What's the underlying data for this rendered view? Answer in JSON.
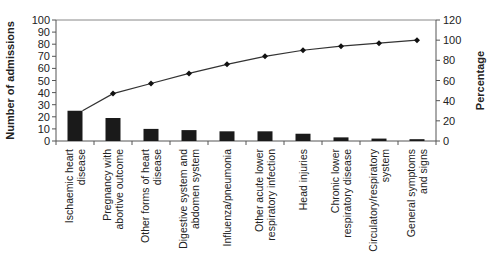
{
  "chart_data": {
    "type": "bar",
    "subtype": "pareto (bar + cumulative line)",
    "title": "",
    "xlabel": "",
    "ylabel": "Number of admissions",
    "y2label": "Percentage",
    "ylim": [
      0,
      100
    ],
    "y2lim": [
      0,
      120
    ],
    "yticks": [
      0,
      10,
      20,
      30,
      40,
      50,
      60,
      70,
      80,
      90,
      100
    ],
    "y2ticks": [
      0,
      20,
      40,
      60,
      80,
      100,
      120
    ],
    "grid": false,
    "legend": "none",
    "categories": [
      [
        "Ischaemic heart",
        "disease"
      ],
      [
        "Pregnancy with",
        "abortive outcome"
      ],
      [
        "Other forms of heart",
        "disease"
      ],
      [
        "Digestive system and",
        "abdomen system"
      ],
      [
        "Influenza/pneumonia"
      ],
      [
        "Other acute lower",
        "respiratory infection"
      ],
      [
        "Head injuries"
      ],
      [
        "Chronic lower",
        "respiratory disease"
      ],
      [
        "Circulatory/respiratory",
        "system"
      ],
      [
        "General symptoms",
        "and signs"
      ]
    ],
    "series": [
      {
        "name": "Number of admissions",
        "type": "bar",
        "axis": "left",
        "color": "#1a1a1a",
        "values": [
          25,
          19,
          10,
          9,
          8,
          8,
          6,
          3,
          2,
          1.5
        ]
      },
      {
        "name": "Cumulative percentage",
        "type": "line",
        "axis": "right",
        "color": "#333333",
        "marker": "diamond",
        "values": [
          30,
          47,
          57,
          67,
          76,
          84,
          90,
          94,
          97,
          100
        ]
      }
    ]
  }
}
